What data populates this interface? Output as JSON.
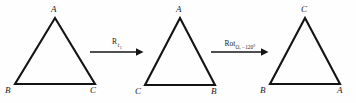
{
  "figure": {
    "background_color": "#fefefe",
    "stroke_color": "#141414",
    "label_color": "#1a1a1a"
  },
  "triangles": [
    {
      "id": "triangle-1",
      "apex_label": "A",
      "bottom_left_label": "B",
      "bottom_right_label": "C",
      "points": "55,18 15,84 95,84",
      "apex": {
        "x": 51,
        "y": 5
      },
      "bottom_left": {
        "x": 5,
        "y": 86
      },
      "bottom_right": {
        "x": 90,
        "y": 86
      }
    },
    {
      "id": "triangle-2",
      "apex_label": "A",
      "bottom_left_label": "C",
      "bottom_right_label": "B",
      "points": "180,18 145,85 215,85",
      "apex": {
        "x": 176,
        "y": 5
      },
      "bottom_left": {
        "x": 135,
        "y": 87
      },
      "bottom_right": {
        "x": 211,
        "y": 87
      }
    },
    {
      "id": "triangle-3",
      "apex_label": "C",
      "bottom_left_label": "B",
      "bottom_right_label": "A",
      "points": "305,18 270,84 340,84",
      "apex": {
        "x": 301,
        "y": 5
      },
      "bottom_left": {
        "x": 260,
        "y": 86
      },
      "bottom_right": {
        "x": 337,
        "y": 86
      }
    }
  ],
  "arrows": [
    {
      "id": "arrow-1",
      "operator": "R",
      "subscript": "ℓ",
      "subscript_index": "1",
      "full_label": "Rℓ₁",
      "x": 90,
      "y": 30,
      "width": 54,
      "height": 26
    },
    {
      "id": "arrow-2",
      "operator": "Rot",
      "subscript": "O, −120°",
      "subscript_index": "",
      "full_label": "Rot O, −120°",
      "x": 211,
      "y": 30,
      "width": 58,
      "height": 26
    }
  ]
}
